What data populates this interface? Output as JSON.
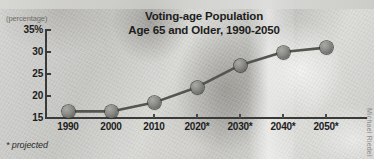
{
  "chart_data": {
    "type": "line",
    "title": "Voting-age Population Age 65 and Older, 1990-2050",
    "title_lines": [
      "Voting-age Population",
      "Age 65 and Older, 1990-2050"
    ],
    "xlabel": "",
    "ylabel": "(percentage)",
    "categories": [
      "1990",
      "2000",
      "2010",
      "2020*",
      "2030*",
      "2040*",
      "2050*"
    ],
    "values": [
      16.5,
      16.5,
      18.5,
      22,
      27,
      30,
      31
    ],
    "ylim": [
      15,
      35
    ],
    "ytick_labels": [
      "35%",
      "30",
      "25",
      "20",
      "15"
    ],
    "ytick_values": [
      35,
      30,
      25,
      20,
      15
    ],
    "grid": false,
    "legend": false,
    "footnote": "* projected",
    "marker": "circle",
    "line_color": "#55554f",
    "marker_color": "#7d7d79",
    "text_color": "#1d1d1d"
  },
  "credit": "Michael Riedel"
}
